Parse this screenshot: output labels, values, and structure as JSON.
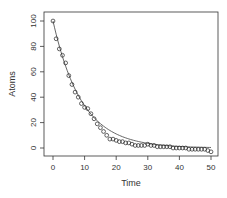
{
  "chart_data": {
    "type": "scatter",
    "title": "",
    "xlabel": "Time",
    "ylabel": "Atoms",
    "xlim": [
      0,
      50
    ],
    "ylim": [
      -5,
      102
    ],
    "x_ticks": [
      0,
      10,
      20,
      30,
      40,
      50
    ],
    "y_ticks": [
      0,
      20,
      40,
      60,
      80,
      100
    ],
    "grid": false,
    "legend": null,
    "series": [
      {
        "name": "observed atoms",
        "kind": "points",
        "marker": "open-circle",
        "x": [
          0,
          1,
          2,
          3,
          4,
          5,
          6,
          7,
          8,
          9,
          10,
          11,
          12,
          13,
          14,
          15,
          16,
          17,
          18,
          19,
          20,
          21,
          22,
          23,
          24,
          25,
          26,
          27,
          28,
          29,
          30,
          31,
          32,
          33,
          34,
          35,
          36,
          37,
          38,
          39,
          40,
          41,
          42,
          43,
          44,
          45,
          46,
          47,
          48,
          49,
          50
        ],
        "values": [
          100,
          86,
          78,
          73,
          67,
          57,
          50,
          44,
          40,
          35,
          32,
          31,
          27,
          23,
          19,
          16,
          13,
          10,
          7,
          7,
          6,
          5,
          5,
          4,
          4,
          3,
          2,
          2,
          2,
          2,
          3,
          2,
          2,
          1,
          1,
          1,
          1,
          1,
          0,
          0,
          0,
          0,
          0,
          -1,
          -1,
          -1,
          -1,
          -1,
          -1,
          -2,
          -3
        ]
      },
      {
        "name": "exponential fit",
        "kind": "line",
        "formula": "100*exp(-0.11*t)",
        "color": "#555555"
      }
    ]
  },
  "axes": {
    "x_label": "Time",
    "y_label": "Atoms",
    "x_tick_labels": [
      "0",
      "10",
      "20",
      "30",
      "40",
      "50"
    ],
    "y_tick_labels": [
      "0",
      "20",
      "40",
      "60",
      "80",
      "100"
    ]
  }
}
